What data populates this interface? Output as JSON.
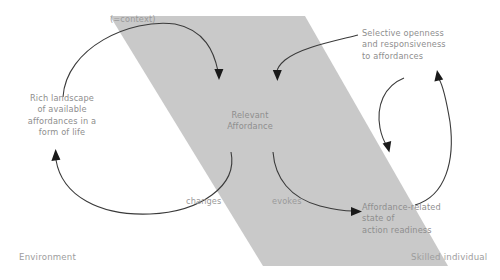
{
  "diagram": {
    "band": {
      "name": "skilled-individual-band",
      "color": "#c9c9c9",
      "shape": "parallelogram"
    },
    "zones": [
      {
        "id": "environment",
        "label": "Environment"
      },
      {
        "id": "skilled-individual",
        "label": "Skilled individual"
      }
    ],
    "nodes": [
      {
        "id": "context",
        "label": "(=context)"
      },
      {
        "id": "rich-landscape",
        "label": "Rich landscape\nof available\naffordances in a\nform of life"
      },
      {
        "id": "relevant-affordance",
        "label": "Relevant\nAffordance"
      },
      {
        "id": "selective-openness",
        "label": "Selective openness\nand responsiveness\nto affordances"
      },
      {
        "id": "action-readiness",
        "label": "Affordance-related\nstate of\naction readiness"
      }
    ],
    "edges": [
      {
        "id": "landscape-to-affordance",
        "label": "(=context)",
        "from": "rich-landscape",
        "to": "relevant-affordance"
      },
      {
        "id": "openness-to-affordance",
        "label": "",
        "from": "selective-openness",
        "to": "relevant-affordance"
      },
      {
        "id": "affordance-to-landscape",
        "label": "changes",
        "from": "relevant-affordance",
        "to": "rich-landscape"
      },
      {
        "id": "affordance-to-readiness",
        "label": "evokes",
        "from": "relevant-affordance",
        "to": "action-readiness"
      },
      {
        "id": "openness-to-readiness",
        "label": "",
        "from": "selective-openness",
        "to": "action-readiness"
      },
      {
        "id": "readiness-to-openness",
        "label": "",
        "from": "action-readiness",
        "to": "selective-openness"
      }
    ],
    "edge_labels": {
      "changes": "changes",
      "evokes": "evokes"
    },
    "colors": {
      "band": "#c9c9c9",
      "text": "#8e8e8e",
      "stroke": "#3a3a3a",
      "background": "#ffffff"
    }
  }
}
